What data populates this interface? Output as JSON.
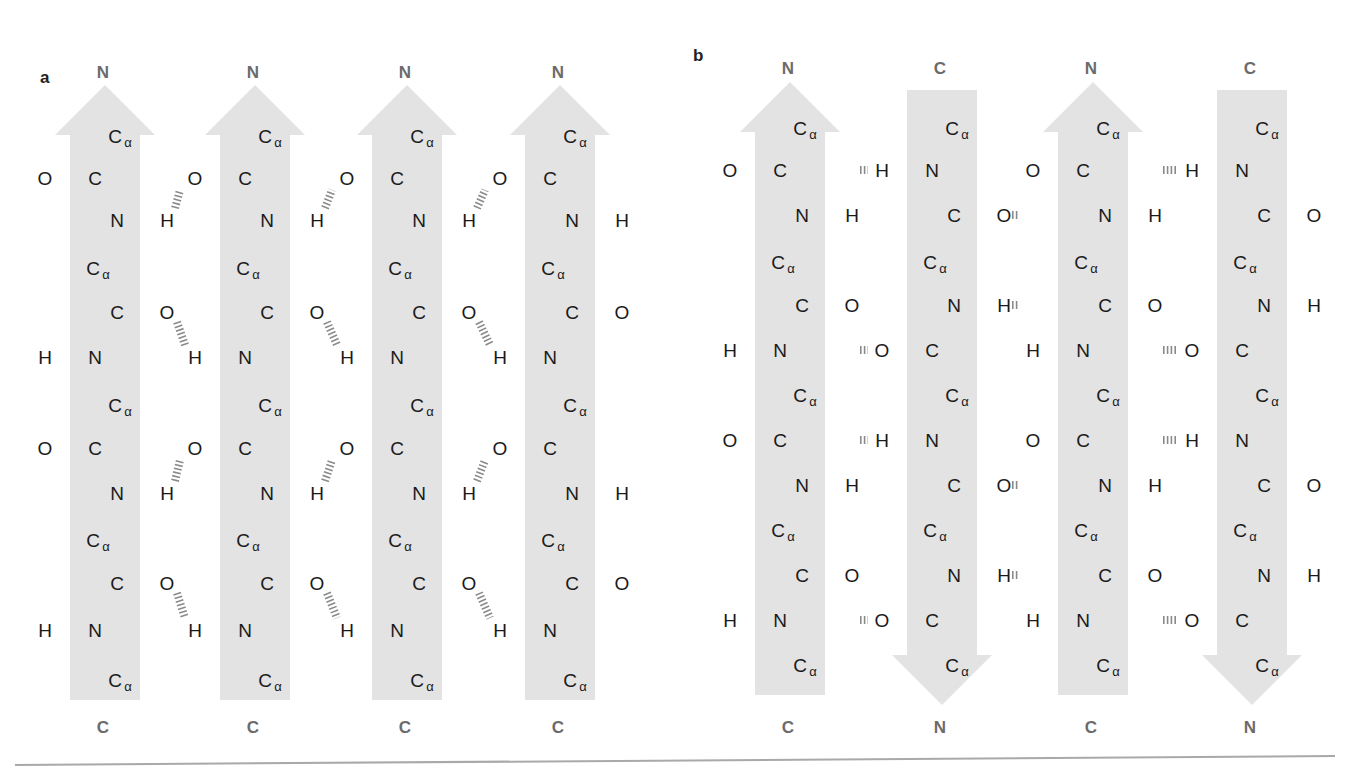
{
  "figure": {
    "colors": {
      "band": "#e3e3e3",
      "atom": "#1a1a1a",
      "terminus": "#6b6b6b",
      "hbond": "#8a8a8a",
      "rule": "#a9a9a9"
    },
    "atoms": {
      "alpha_carbon": "C",
      "alpha_sub": "α",
      "carbon": "C",
      "nitrogen": "N",
      "oxygen": "O",
      "hydrogen": "H"
    },
    "panels": [
      {
        "id": "a",
        "label": "a",
        "title": "Parallel β-sheet",
        "strands": [
          {
            "center": 105,
            "direction": "up",
            "top_label": "N",
            "bottom_label": "C"
          },
          {
            "center": 255,
            "direction": "up",
            "top_label": "N",
            "bottom_label": "C"
          },
          {
            "center": 407,
            "direction": "up",
            "top_label": "N",
            "bottom_label": "C"
          },
          {
            "center": 560,
            "direction": "up",
            "top_label": "N",
            "bottom_label": "C"
          }
        ]
      },
      {
        "id": "b",
        "label": "b",
        "title": "Antiparallel β-sheet",
        "strands": [
          {
            "center": 790,
            "direction": "up",
            "top_label": "N",
            "bottom_label": "C"
          },
          {
            "center": 942,
            "direction": "down",
            "top_label": "C",
            "bottom_label": "N"
          },
          {
            "center": 1093,
            "direction": "up",
            "top_label": "N",
            "bottom_label": "C"
          },
          {
            "center": 1252,
            "direction": "down",
            "top_label": "C",
            "bottom_label": "N"
          }
        ]
      }
    ]
  }
}
